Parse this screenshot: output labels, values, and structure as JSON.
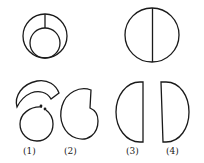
{
  "figure": {
    "top_left": {
      "name": "composite-figure-nested-circles"
    },
    "top_right": {
      "name": "circle-split-by-diameter"
    },
    "options": [
      {
        "label": "(1)",
        "name": "option-1-arc-and-circle"
      },
      {
        "label": "(2)",
        "name": "option-2-notched-shape"
      },
      {
        "label": "(3)",
        "name": "option-3-left-half-disc"
      },
      {
        "label": "(4)",
        "name": "option-4-right-half-disc"
      }
    ],
    "stroke_color": "#1a1a1a",
    "background": "#ffffff"
  }
}
